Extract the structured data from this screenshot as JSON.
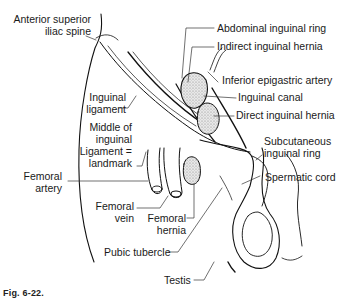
{
  "figure": {
    "labels": {
      "asis": [
        "Anterior superior",
        "iliac spine"
      ],
      "abdominal_ring": "Abdominal inguinal ring",
      "indirect_hernia": "Indirect inguinal hernia",
      "inferior_epigastric": "Inferior epigastric artery",
      "inguinal_canal": "Inguinal canal",
      "direct_hernia": "Direct inguinal hernia",
      "inguinal_ligament": [
        "Inguinal",
        "ligament"
      ],
      "middle_landmark": [
        "Middle of",
        "inguinal",
        "Ligament =",
        "landmark"
      ],
      "subcutaneous_ring": [
        "Subcutaneous",
        "inguinal ring"
      ],
      "spermatic_cord": "Spermatic cord",
      "femoral_artery": [
        "Femoral",
        "artery"
      ],
      "femoral_vein": [
        "Femoral",
        "vein"
      ],
      "femoral_hernia": [
        "Femoral",
        "hernia"
      ],
      "pubic_tubercle": "Pubic tubercle",
      "testis": "Testis"
    },
    "caption": "Fig. 6-22."
  }
}
